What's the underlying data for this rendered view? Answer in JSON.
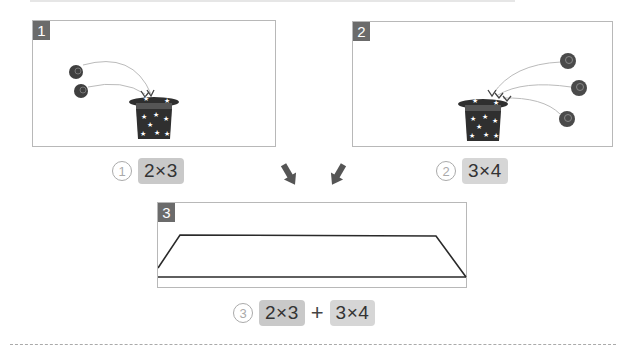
{
  "panels": [
    {
      "number": "1",
      "balls": 2,
      "caption_marker": "①",
      "expression": "2×3"
    },
    {
      "number": "2",
      "balls": 3,
      "caption_marker": "②",
      "expression": "3×4"
    },
    {
      "number": "3",
      "caption_marker": "③",
      "expression_left": "2×3",
      "operator": "+",
      "expression_right": "3×4"
    }
  ],
  "colors": {
    "badge": "#6b6b6b",
    "panel_border": "#b8b8b8",
    "pill": "#c9c9c9",
    "hat": "#2f2f2f",
    "ball": "#4a4a4a",
    "arrow": "#5a5a5a"
  },
  "icons": {
    "hat": "magic-hat-icon",
    "ball": "ball-icon",
    "down_arrow": "arrow-down-icon"
  }
}
